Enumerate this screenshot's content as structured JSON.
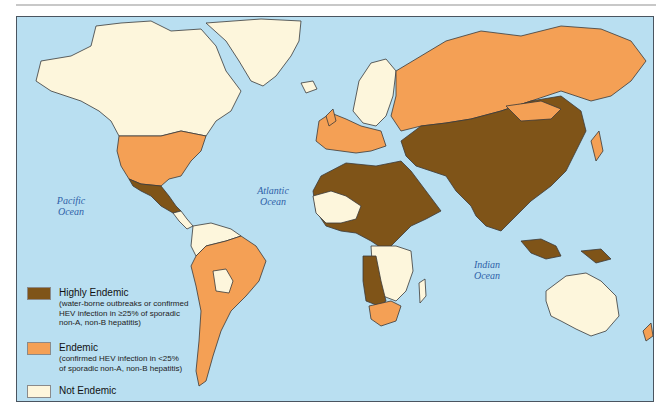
{
  "map": {
    "title": "Geographic distribution of hepatitis E virus (HEV)",
    "colors": {
      "ocean": "#b9dff1",
      "highly_endemic": "#7f5418",
      "endemic": "#f4a055",
      "not_endemic": "#fdf6dc",
      "border": "#3a3a3a",
      "frame": "#4a5560"
    },
    "ocean_labels": [
      {
        "line1": "Pacific",
        "line2": "Ocean"
      },
      {
        "line1": "Atlantic",
        "line2": "Ocean"
      },
      {
        "line1": "Indian",
        "line2": "Ocean"
      }
    ]
  },
  "legend": {
    "items": [
      {
        "title": "Highly Endemic",
        "description_lines": [
          "(water-borne outbreaks or confirmed",
          "HEV infection in ≥25% of sporadic",
          "non-A, non-B hepatitis)"
        ]
      },
      {
        "title": "Endemic",
        "description_lines": [
          "(confirmed HEV infection in <25%",
          "of sporadic non-A, non-B hepatitis)"
        ]
      },
      {
        "title": "Not Endemic",
        "description_lines": []
      }
    ]
  }
}
